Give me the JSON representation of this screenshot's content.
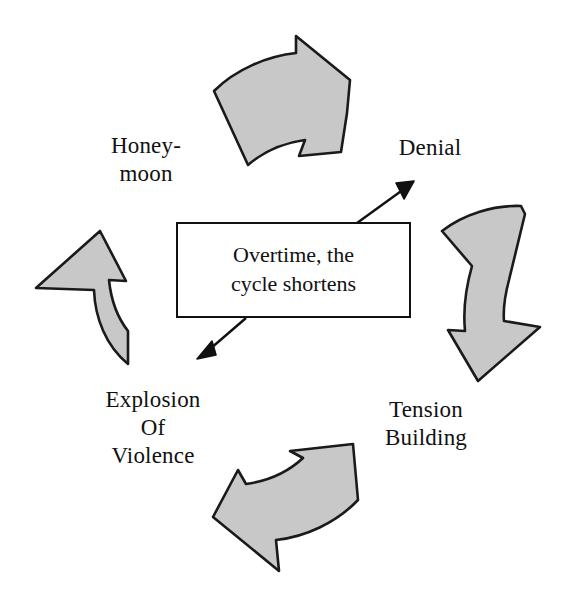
{
  "diagram": {
    "type": "cyclical-process-diagram",
    "background_color": "#ffffff",
    "arrow_fill_color": "#c8c8c8",
    "arrow_stroke_color": "#1a1a1a",
    "text_color": "#111111"
  },
  "center_note": {
    "text": "Overtime, the\ncycle shortens",
    "line1": "Overtime, the",
    "line2": "cycle shortens",
    "border_color": "#111111",
    "fill_color": "#ffffff"
  },
  "phases": [
    {
      "id": "denial",
      "label": "Denial",
      "order": 1,
      "position": "top-right"
    },
    {
      "id": "tension-building",
      "label": "Tension\nBuilding",
      "line1": "Tension",
      "line2": "Building",
      "order": 2,
      "position": "bottom-right"
    },
    {
      "id": "explosion-of-violence",
      "label": "Explosion\nOf\nViolence",
      "line1": "Explosion",
      "line2": "Of",
      "line3": "Violence",
      "order": 3,
      "position": "bottom-left"
    },
    {
      "id": "honeymoon",
      "label": "Honey-\nmoon",
      "line1": "Honey-",
      "line2": "moon",
      "order": 4,
      "position": "top-left"
    }
  ],
  "cycle_arrows": [
    {
      "id": "arrow-top",
      "name": "curved-arrow-honeymoon-to-denial",
      "direction": "right",
      "from": "honeymoon",
      "to": "denial"
    },
    {
      "id": "arrow-right",
      "name": "curved-arrow-denial-to-tension",
      "direction": "down",
      "from": "denial",
      "to": "tension-building"
    },
    {
      "id": "arrow-bottom",
      "name": "curved-arrow-tension-to-explosion",
      "direction": "left",
      "from": "tension-building",
      "to": "explosion-of-violence"
    },
    {
      "id": "arrow-left",
      "name": "curved-arrow-explosion-to-honeymoon",
      "direction": "up",
      "from": "explosion-of-violence",
      "to": "honeymoon"
    }
  ],
  "pointer_arrows": [
    {
      "id": "pointer-upper-right",
      "name": "note-pointer-to-denial",
      "direction": "up-right",
      "target": "denial"
    },
    {
      "id": "pointer-lower-left",
      "name": "note-pointer-to-explosion",
      "direction": "down-left",
      "target": "explosion-of-violence"
    }
  ]
}
